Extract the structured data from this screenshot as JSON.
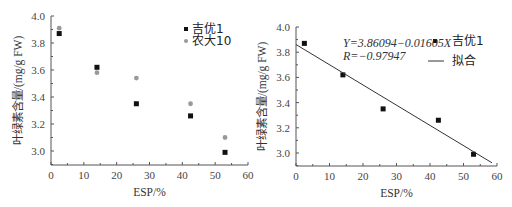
{
  "chart_data": [
    {
      "type": "scatter",
      "title": "",
      "xlabel": "ESP/%",
      "ylabel": "叶绿素含量/(mg/g FW)",
      "xlim": [
        0,
        60
      ],
      "ylim": [
        2.9,
        4.0
      ],
      "xticks": [
        "0",
        "10",
        "20",
        "30",
        "40",
        "50",
        "60"
      ],
      "yticks": [
        "3.0",
        "3.2",
        "3.4",
        "3.6",
        "3.8",
        "4.0"
      ],
      "grid": false,
      "legend_position": "upper right",
      "series": [
        {
          "name": "吉优1",
          "marker": "square",
          "color": "#111111",
          "x": [
            2.5,
            14,
            26,
            42.5,
            53
          ],
          "y": [
            3.87,
            3.62,
            3.35,
            3.26,
            2.99
          ]
        },
        {
          "name": "农大10",
          "marker": "circle",
          "color": "#999999",
          "x": [
            2.5,
            14,
            26,
            42.5,
            53
          ],
          "y": [
            3.91,
            3.58,
            3.54,
            3.35,
            3.1
          ]
        }
      ]
    },
    {
      "type": "scatter",
      "title": "",
      "xlabel": "ESP/%",
      "ylabel": "叶绿素含量/(mg/g FW)",
      "xlim": [
        0,
        60
      ],
      "ylim": [
        2.9,
        4.0
      ],
      "xticks": [
        "0",
        "10",
        "20",
        "30",
        "40",
        "50",
        "60"
      ],
      "yticks": [
        "3.0",
        "3.2",
        "3.4",
        "3.6",
        "3.8",
        "4.0"
      ],
      "grid": false,
      "legend_position": "upper right",
      "annotations": [
        "Y=3.86094−0.01605X",
        "R=−0.97947"
      ],
      "series": [
        {
          "name": "吉优1",
          "marker": "square",
          "color": "#111111",
          "x": [
            2.5,
            14,
            26,
            42.5,
            53
          ],
          "y": [
            3.87,
            3.62,
            3.35,
            3.26,
            2.99
          ]
        },
        {
          "name": "拟合",
          "type": "line",
          "color": "#333333",
          "x": [
            0,
            58.5
          ],
          "y": [
            3.86094,
            2.92202
          ]
        }
      ]
    }
  ],
  "left": {
    "xlabel": "ESP/%",
    "ylabel": "叶绿素含量/(mg/g FW)",
    "legend": [
      "吉优1",
      "农大10"
    ]
  },
  "right": {
    "xlabel": "ESP/%",
    "ylabel": "叶绿素含量/(mg/g FW)",
    "equation": "Y=3.86094−0.01605X",
    "r_value": "R=−0.97947",
    "legend": [
      "吉优1",
      "拟合"
    ]
  }
}
